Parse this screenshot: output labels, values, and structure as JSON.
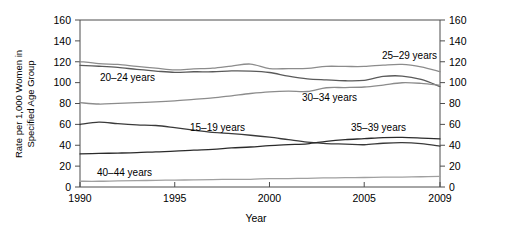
{
  "chart_data": {
    "type": "line",
    "title": "",
    "xlabel": "Year",
    "ylabel": "Rate per 1,000 Women in Specified Age Group",
    "xlim": [
      1990,
      2009
    ],
    "ylim": [
      0,
      160
    ],
    "ytick_labels": [
      "0",
      "20",
      "40",
      "60",
      "80",
      "100",
      "120",
      "140",
      "160"
    ],
    "yticks": [
      0,
      20,
      40,
      60,
      80,
      100,
      120,
      140,
      160
    ],
    "xtick_labels": [
      "1990",
      "1995",
      "2000",
      "2005",
      "2009"
    ],
    "xticks": [
      1990,
      1995,
      2000,
      2005,
      2009
    ],
    "grid": false,
    "legend_position": "inline-annotations",
    "mirrored_y_axis": true,
    "x": [
      1990,
      1991,
      1992,
      1993,
      1994,
      1995,
      1996,
      1997,
      1998,
      1999,
      2000,
      2001,
      2002,
      2003,
      2004,
      2005,
      2006,
      2007,
      2008,
      2009
    ],
    "series": [
      {
        "name": "15-19 years",
        "label": "15–19 years",
        "color": "#3a3a3a",
        "width": 1.3,
        "values": [
          59.9,
          62.1,
          60.7,
          59.6,
          58.9,
          56.8,
          54.4,
          52.3,
          51.1,
          49.6,
          47.7,
          45.3,
          43.0,
          41.6,
          41.1,
          40.5,
          41.9,
          42.5,
          41.5,
          39.1
        ]
      },
      {
        "name": "20-24 years",
        "label": "20–24 years",
        "color": "#5a5a5a",
        "width": 1.3,
        "values": [
          116.5,
          115.7,
          114.6,
          112.6,
          111.1,
          109.8,
          110.4,
          110.4,
          111.2,
          111.0,
          109.7,
          106.2,
          103.6,
          102.6,
          101.8,
          102.2,
          105.9,
          106.3,
          103.0,
          96.3
        ]
      },
      {
        "name": "25-29 years",
        "label": "25–29 years",
        "color": "#8c8c8c",
        "width": 1.3,
        "values": [
          120.2,
          118.2,
          117.4,
          115.5,
          113.9,
          112.2,
          113.1,
          113.8,
          115.9,
          117.8,
          113.5,
          113.4,
          113.6,
          115.6,
          115.5,
          115.5,
          116.8,
          117.5,
          115.1,
          110.5
        ]
      },
      {
        "name": "30-34 years",
        "label": "30–34 years",
        "color": "#8c8c8c",
        "width": 1.3,
        "values": [
          80.8,
          79.5,
          80.2,
          80.8,
          81.5,
          82.5,
          83.9,
          85.3,
          87.4,
          89.6,
          91.2,
          91.9,
          91.5,
          95.1,
          95.3,
          95.8,
          97.7,
          99.9,
          99.3,
          97.5
        ]
      },
      {
        "name": "35-39 years",
        "label": "35–39 years",
        "color": "#2b2b2b",
        "width": 1.3,
        "values": [
          31.7,
          32.2,
          32.5,
          32.9,
          33.7,
          34.3,
          35.3,
          36.1,
          37.4,
          38.3,
          39.7,
          40.6,
          41.4,
          43.8,
          45.4,
          46.3,
          47.3,
          47.5,
          46.9,
          46.1
        ]
      },
      {
        "name": "40-44 years",
        "label": "40–44 years",
        "color": "#a0a0a0",
        "width": 1.3,
        "values": [
          5.5,
          5.5,
          5.9,
          6.1,
          6.4,
          6.6,
          6.8,
          7.1,
          7.3,
          7.4,
          8.0,
          8.1,
          8.3,
          8.7,
          8.9,
          9.1,
          9.4,
          9.5,
          9.8,
          10.1
        ]
      }
    ],
    "annotations": [
      {
        "name": "20-24 years",
        "text": "20–24 years",
        "x_px": 100,
        "y_px": 81
      },
      {
        "name": "25-29 years",
        "text": "25–29 years",
        "x_px": 382,
        "y_px": 59
      },
      {
        "name": "30-34 years",
        "text": "30–34 years",
        "x_px": 302,
        "y_px": 101
      },
      {
        "name": "15-19 years",
        "text": "15–19 years",
        "x_px": 190,
        "y_px": 131
      },
      {
        "name": "35-39 years",
        "text": "35–39 years",
        "x_px": 351,
        "y_px": 131
      },
      {
        "name": "40-44 years",
        "text": "40–44 years",
        "x_px": 97,
        "y_px": 176
      }
    ]
  }
}
